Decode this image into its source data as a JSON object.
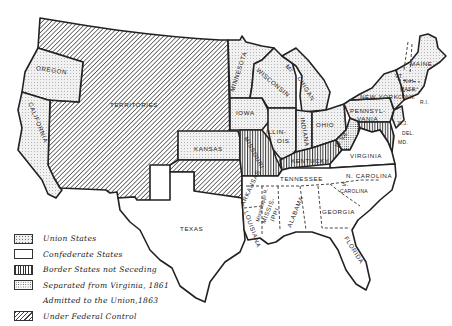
{
  "map": {
    "title": "",
    "regions": {
      "oregon": "OREGON",
      "california": "CALIFORNIA",
      "territories": "TERRITORIES",
      "minnesota": "MINNESOTA",
      "iowa": "IOWA",
      "kansas": "KANSAS",
      "texas": "TEXAS",
      "wisconsin": "WISCONSIN",
      "michigan_top": "MI",
      "michigan_bottom": "CHIGAN",
      "illinois_1": "ILLIN-",
      "illinois_2": "OIS",
      "indiana": "INDIANA",
      "ohio": "OHIO",
      "missouri": "MISSOURI",
      "kentucky": "KENTUCKY",
      "tennessee": "TENNESSEE",
      "arkansas": "ARKANSAS",
      "mississippi_river": "Mississippi R.",
      "louisiana": "LOUISIANA",
      "mississippi_1": "MISSIS-",
      "mississippi_2": "IPPI",
      "alabama": "ALABAMA",
      "georgia": "GEORGIA",
      "florida": "FLORIDA",
      "s_carolina_1": "S.",
      "s_carolina_2": "CAROLINA",
      "n_carolina": "N. CAROLINA",
      "virginia": "VIRGINIA",
      "w_virginia": "W.VA.",
      "pennsylvania_1": "PENNSYL-",
      "pennsylvania_2": "VANIA",
      "new_york": "NEW YORK",
      "maine": "MAINE",
      "vermont": "VT.",
      "new_hampshire": "N.H.",
      "massachusetts": "MASS.",
      "connecticut": "CONN.",
      "rhode_island": "R.I.",
      "new_jersey": "N.J.",
      "delaware": "DEL.",
      "maryland": "MD."
    },
    "pattern_colors": {
      "ink": "#222222",
      "paper": "#ffffff",
      "union_fill": "#efefef"
    }
  },
  "legend": {
    "items": [
      {
        "pattern": "union-dots",
        "label": "Union States"
      },
      {
        "pattern": "blank",
        "label": "Confederate States"
      },
      {
        "pattern": "vertical-lines",
        "label": "Border States not Seceding"
      },
      {
        "pattern": "dense-dots",
        "label": "Separated from Virginia, 1861"
      },
      {
        "pattern": "none",
        "label": "Admitted to the Union,1863"
      },
      {
        "pattern": "diagonal-hatch",
        "label": "Under Federal Control"
      }
    ]
  }
}
